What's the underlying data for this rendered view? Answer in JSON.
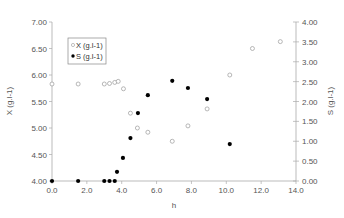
{
  "chart_data": {
    "type": "scatter",
    "title": "",
    "xlabel": "h",
    "ylabel": "X (g.l-1)",
    "y2label": "S (g.l-1)",
    "xlim": [
      0,
      14
    ],
    "ylim": [
      4.0,
      7.0
    ],
    "y2lim": [
      0.0,
      4.0
    ],
    "grid": false,
    "legend_position": "upper-left-inside",
    "x_ticks": [
      "0.0",
      "2.0",
      "4.0",
      "6.0",
      "8.0",
      "10.0",
      "12.0",
      "14.0"
    ],
    "y_ticks": [
      "4.00",
      "4.50",
      "5.00",
      "5.50",
      "6.00",
      "6.50",
      "7.00"
    ],
    "y2_ticks": [
      "0.00",
      "0.50",
      "1.00",
      "1.50",
      "2.00",
      "2.50",
      "3.00",
      "3.50",
      "4.00"
    ],
    "series": [
      {
        "name": "X (g.l-1)",
        "axis": "left",
        "marker": "open-circle",
        "color": "#999999",
        "points": [
          [
            0.0,
            5.83
          ],
          [
            1.5,
            5.83
          ],
          [
            3.0,
            5.83
          ],
          [
            3.3,
            5.84
          ],
          [
            3.6,
            5.86
          ],
          [
            3.8,
            5.88
          ],
          [
            4.1,
            5.74
          ],
          [
            4.5,
            5.28
          ],
          [
            4.9,
            5.0
          ],
          [
            5.5,
            4.92
          ],
          [
            6.9,
            4.75
          ],
          [
            7.8,
            5.04
          ],
          [
            8.9,
            5.36
          ],
          [
            10.2,
            6.0
          ],
          [
            11.5,
            6.5
          ],
          [
            13.1,
            6.63
          ]
        ]
      },
      {
        "name": "S (g.l-1)",
        "axis": "right",
        "marker": "filled-circle",
        "color": "#000000",
        "points": [
          [
            0.0,
            0.0
          ],
          [
            1.5,
            0.0
          ],
          [
            3.0,
            0.0
          ],
          [
            3.3,
            0.0
          ],
          [
            3.6,
            0.0
          ],
          [
            3.73,
            0.23
          ],
          [
            4.07,
            0.58
          ],
          [
            4.5,
            1.08
          ],
          [
            4.93,
            1.71
          ],
          [
            5.5,
            2.16
          ],
          [
            6.9,
            2.52
          ],
          [
            7.8,
            2.34
          ],
          [
            8.9,
            2.06
          ],
          [
            10.2,
            0.93
          ]
        ]
      }
    ]
  }
}
